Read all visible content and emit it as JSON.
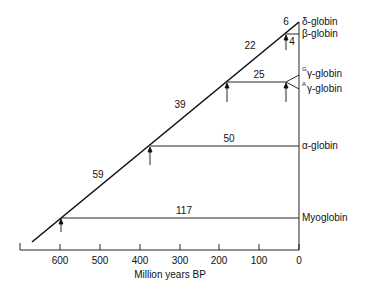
{
  "diagram": {
    "title": "",
    "x_axis": {
      "label": "Million years BP",
      "ticks": [
        "600",
        "500",
        "400",
        "300",
        "200",
        "100",
        "0"
      ]
    },
    "branch_lengths": {
      "myoglobin_branch": "117",
      "alpha_branch": "50",
      "gamma_branch": "25",
      "beta_delta_stem": "22",
      "delta_branch": "6",
      "beta_branch": "4",
      "stem_59": "59",
      "stem_39": "39"
    },
    "genes": {
      "delta": "δ-globin",
      "beta": "β-globin",
      "g_gamma_sup": "G",
      "g_gamma": "γ-globin",
      "a_gamma_sup": "A",
      "a_gamma": "γ-globin",
      "alpha": "α-globin",
      "myoglobin": "Myoglobin"
    },
    "divergence_times_mya": {
      "myoglobin_split": 600,
      "alpha_split": 370,
      "gamma_split": 180,
      "gamma_duplication": 30,
      "beta_delta_split": 35
    }
  }
}
